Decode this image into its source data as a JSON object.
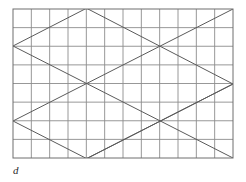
{
  "figure": {
    "caption": "d",
    "type": "line-diagram",
    "canvas": {
      "width": 246,
      "height": 182,
      "background": "#ffffff"
    },
    "grid": {
      "x0": 13,
      "y0": 9,
      "x1": 233,
      "y1": 158,
      "columns": 12,
      "rows": 8,
      "cell_width": 18.333,
      "cell_height": 18.625,
      "line_color": "#8c8c8c",
      "line_width": 0.9,
      "border_color": "#6e6e6e",
      "border_width": 1.0,
      "visible": true
    },
    "pattern": {
      "line_color": "#5a5a5a",
      "line_width": 1.0,
      "description": "Interlocking rhombi / zigzag lattice with diagonals of slope plus and minus one half",
      "vertices": [
        {
          "name": "top-apex-left",
          "x": 88,
          "y": 9
        },
        {
          "name": "top-right-corner",
          "x": 233,
          "y": 9
        },
        {
          "name": "left-upper-vertex",
          "x": 13,
          "y": 46
        },
        {
          "name": "upper-right-crossing",
          "x": 160,
          "y": 46
        },
        {
          "name": "center-crossing",
          "x": 88,
          "y": 84
        },
        {
          "name": "right-middle-vertex",
          "x": 233,
          "y": 84
        },
        {
          "name": "left-lower-vertex",
          "x": 13,
          "y": 121
        },
        {
          "name": "lower-right-crossing",
          "x": 160,
          "y": 121
        },
        {
          "name": "bottom-apex",
          "x": 88,
          "y": 158
        },
        {
          "name": "bottom-right-corner",
          "x": 233,
          "y": 158
        }
      ],
      "segments": [
        {
          "name": "diag-down-a",
          "x1": 13,
          "y1": 46,
          "x2": 233,
          "y2": 158
        },
        {
          "name": "diag-down-b",
          "x1": 13,
          "y1": 121,
          "x2": 160,
          "y2": 196
        },
        {
          "name": "diag-down-c",
          "x1": 88,
          "y1": 9,
          "x2": 233,
          "y2": 84
        },
        {
          "name": "diag-down-d",
          "x1": 13,
          "y1": -29,
          "x2": 88,
          "y2": 9
        },
        {
          "name": "diag-up-a",
          "x1": 13,
          "y1": 46,
          "x2": 233,
          "y2": -67
        },
        {
          "name": "diag-up-b",
          "x1": 13,
          "y1": 121,
          "x2": 233,
          "y2": 9
        },
        {
          "name": "diag-up-c",
          "x1": 13,
          "y1": 196,
          "x2": 233,
          "y2": 84
        },
        {
          "name": "diag-up-d",
          "x1": 88,
          "y1": 158,
          "x2": 233,
          "y2": 84
        },
        {
          "name": "diag-up-e",
          "x1": 13,
          "y1": 196,
          "x2": 88,
          "y2": 158
        }
      ]
    }
  }
}
